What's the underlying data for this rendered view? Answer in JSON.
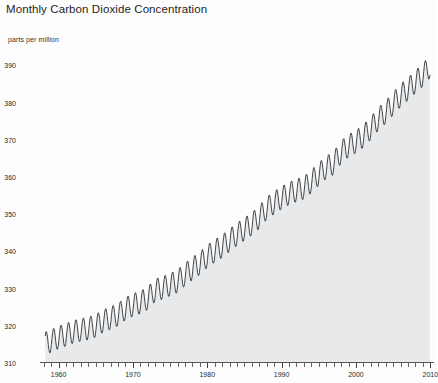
{
  "chart_data": {
    "type": "area",
    "title": "Monthly Carbon Dioxide Concentration",
    "subtitle": "parts per million",
    "ylabel": "parts per million",
    "xlabel": "",
    "ylim": [
      310,
      392
    ],
    "xlim": [
      1957.5,
      2010.5
    ],
    "yticks": [
      310,
      320,
      330,
      340,
      350,
      360,
      370,
      380,
      390
    ],
    "ytick_labels": [
      "310",
      "320",
      "330",
      "340",
      "350",
      "360",
      "370",
      "380",
      "390"
    ],
    "xticks": [
      1960,
      1970,
      1980,
      1990,
      2000,
      2010
    ],
    "xtick_labels": [
      "1960",
      "1970",
      "1980",
      "1990",
      "2000",
      "2010"
    ],
    "xtick_minor_step": 1,
    "grid": true,
    "grid_color": "#ffffff",
    "fill_color": "#e7e9eb",
    "line_color": "#2e3236",
    "line_width": 0.9,
    "legend": null,
    "series": [
      {
        "name": "Monthly mean CO2 concentration",
        "seasonal_amplitude_ppm": 3.1,
        "seasonal_peak_month": 5,
        "seasonal_trough_month": 10,
        "x": [
          1958.2,
          1959,
          1960,
          1961,
          1962,
          1963,
          1964,
          1965,
          1966,
          1967,
          1968,
          1969,
          1970,
          1971,
          1972,
          1973,
          1974,
          1975,
          1976,
          1977,
          1978,
          1979,
          1980,
          1981,
          1982,
          1983,
          1984,
          1985,
          1986,
          1987,
          1988,
          1989,
          1990,
          1991,
          1992,
          1993,
          1994,
          1995,
          1996,
          1997,
          1998,
          1999,
          2000,
          2001,
          2002,
          2003,
          2004,
          2005,
          2006,
          2007,
          2008,
          2009,
          2010
        ],
        "values": [
          315.3,
          315.9,
          316.9,
          317.6,
          318.4,
          318.9,
          319.3,
          320.0,
          321.3,
          322.1,
          323.0,
          324.6,
          325.6,
          326.3,
          327.4,
          329.6,
          330.2,
          331.1,
          332.0,
          333.8,
          335.4,
          336.8,
          338.7,
          340.1,
          341.4,
          343.0,
          344.6,
          346.0,
          347.4,
          349.2,
          351.6,
          353.1,
          354.4,
          355.6,
          356.4,
          357.1,
          358.8,
          360.8,
          362.6,
          363.7,
          366.7,
          368.4,
          369.5,
          371.0,
          373.1,
          375.6,
          377.4,
          379.7,
          381.9,
          383.7,
          385.6,
          387.4,
          389.8
        ]
      }
    ]
  },
  "chart": {
    "title": "Monthly Carbon Dioxide Concentration",
    "subtitle": "parts per million"
  },
  "axes": {
    "y": {
      "labels": [
        {
          "text": "390",
          "value": 390
        },
        {
          "text": "380",
          "value": 380
        },
        {
          "text": "370",
          "value": 370
        },
        {
          "text": "360",
          "value": 360
        },
        {
          "text": "350",
          "value": 350
        },
        {
          "text": "340",
          "value": 340
        },
        {
          "text": "330",
          "value": 330
        },
        {
          "text": "320",
          "value": 320
        },
        {
          "text": "310",
          "value": 310
        }
      ]
    },
    "x": {
      "labels": [
        {
          "text": "1960",
          "value": 1960
        },
        {
          "text": "1970",
          "value": 1970
        },
        {
          "text": "1980",
          "value": 1980
        },
        {
          "text": "1990",
          "value": 1990
        },
        {
          "text": "2000",
          "value": 2000
        },
        {
          "text": "2010",
          "value": 2010
        }
      ]
    }
  }
}
